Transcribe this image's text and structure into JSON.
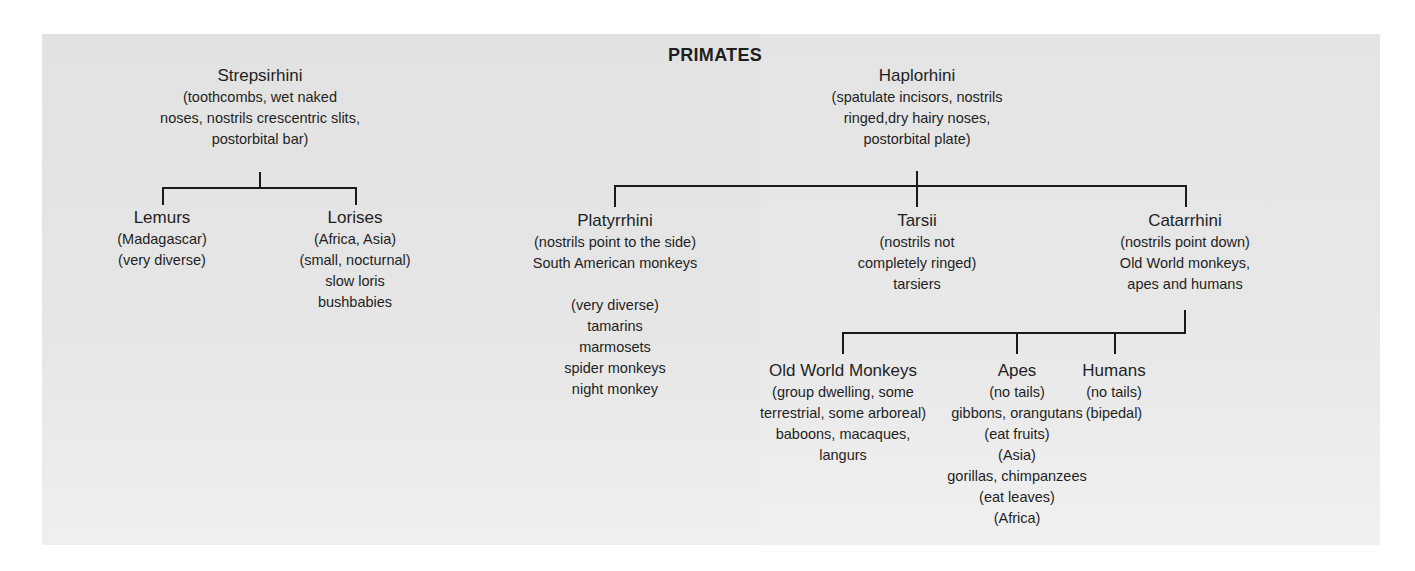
{
  "title": "PRIMATES",
  "nodes": {
    "strepsirhini": {
      "name": "Strepsirhini",
      "lines": [
        "(toothcombs, wet naked",
        "noses, nostrils crescentric slits,",
        "postorbital bar)"
      ]
    },
    "haplorhini": {
      "name": "Haplorhini",
      "lines": [
        "(spatulate incisors, nostrils",
        "ringed,dry hairy noses,",
        "postorbital plate)"
      ]
    },
    "lemurs": {
      "name": "Lemurs",
      "lines": [
        "(Madagascar)",
        "(very diverse)"
      ]
    },
    "lorises": {
      "name": "Lorises",
      "lines": [
        "(Africa, Asia)",
        "(small, nocturnal)",
        "slow loris",
        "bushbabies"
      ]
    },
    "platyrrhini": {
      "name": "Platyrrhini",
      "lines": [
        "(nostrils point to the side)",
        "South American monkeys",
        "",
        "(very diverse)",
        "tamarins",
        "marmosets",
        "spider monkeys",
        "night monkey"
      ]
    },
    "tarsii": {
      "name": "Tarsii",
      "lines": [
        "(nostrils not",
        "completely ringed)",
        "tarsiers"
      ]
    },
    "catarrhini": {
      "name": "Catarrhini",
      "lines": [
        "(nostrils point down)",
        "Old World monkeys,",
        "apes and humans"
      ]
    },
    "old_world_monkeys": {
      "name": "Old World Monkeys",
      "lines": [
        "(group dwelling, some",
        "terrestrial, some arboreal)",
        "baboons, macaques,",
        "langurs"
      ]
    },
    "apes": {
      "name": "Apes",
      "lines": [
        "(no tails)",
        "gibbons, orangutans",
        "(eat fruits)",
        "(Asia)",
        "gorillas, chimpanzees",
        "(eat leaves)",
        "(Africa)"
      ]
    },
    "humans": {
      "name": "Humans",
      "lines": [
        "(no tails)",
        "(bipedal)"
      ]
    }
  },
  "colors": {
    "panel_bg": "#e4e4e4",
    "line": "#1a1a1a",
    "text": "#1f1f1f"
  }
}
